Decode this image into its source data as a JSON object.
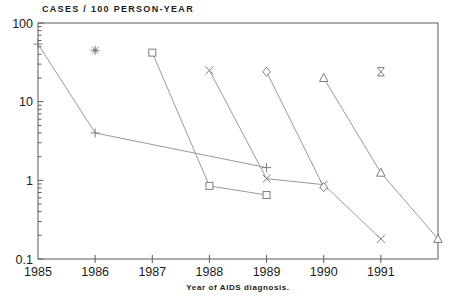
{
  "page": {
    "background": "#ffffff"
  },
  "chart_data": {
    "type": "line",
    "title": "CASES / 100 PERSON-YEAR",
    "xlabel": "Year of AIDS diagnosis.",
    "ylabel": "",
    "y_scale": "log",
    "ylim": [
      0.1,
      100
    ],
    "xlim": [
      1985,
      1992
    ],
    "x_ticks": [
      1985,
      1986,
      1987,
      1988,
      1989,
      1990,
      1991
    ],
    "y_ticks": [
      100,
      10,
      1,
      0.1
    ],
    "grid": false,
    "legend": "none",
    "frame": "full-box",
    "colors": {
      "axis": "#5a5a5a",
      "line": "#9a9a9a",
      "marker": "#7d7d7d",
      "text": "#1c1c1c"
    },
    "series": [
      {
        "name": "1985-cohort",
        "marker": "plus",
        "points": [
          [
            1985,
            54
          ],
          [
            1986,
            4.0
          ],
          [
            1989,
            1.45
          ]
        ]
      },
      {
        "name": "1986-cohort",
        "marker": "asterisk",
        "points": [
          [
            1986,
            45
          ]
        ]
      },
      {
        "name": "1987-cohort",
        "marker": "square",
        "points": [
          [
            1987,
            42
          ],
          [
            1988,
            0.85
          ],
          [
            1989,
            0.65
          ]
        ]
      },
      {
        "name": "1988-cohort",
        "marker": "x",
        "points": [
          [
            1988,
            25
          ],
          [
            1989,
            1.05
          ],
          [
            1990,
            0.88
          ],
          [
            1991,
            0.18
          ]
        ]
      },
      {
        "name": "1989-cohort",
        "marker": "diamond",
        "points": [
          [
            1989,
            24
          ],
          [
            1990,
            0.82
          ]
        ]
      },
      {
        "name": "1990-cohort",
        "marker": "triangle",
        "points": [
          [
            1990,
            20
          ],
          [
            1991,
            1.25
          ],
          [
            1992,
            0.18
          ]
        ]
      },
      {
        "name": "1991-cohort",
        "marker": "hourglass",
        "points": [
          [
            1991,
            24
          ]
        ]
      }
    ]
  }
}
